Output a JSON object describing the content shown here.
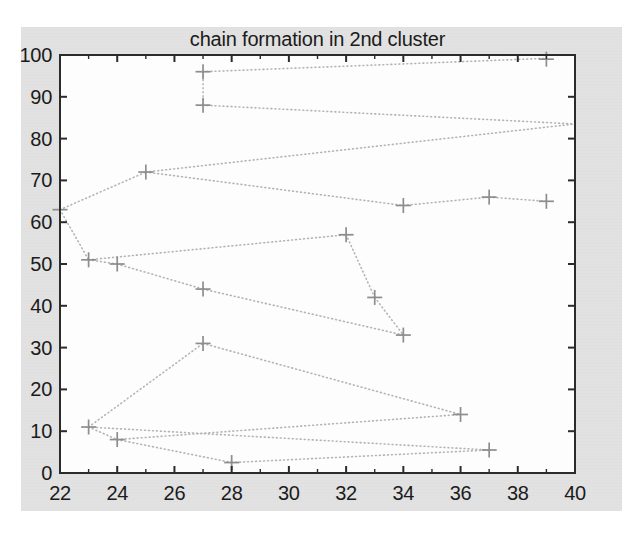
{
  "figure": {
    "title": "chain formation in 2nd cluster",
    "page_background": "#e2e2e2",
    "plot_background": "#fdfdfd",
    "axis_color": "#2b2b2b",
    "marker_color": "#8d8d8d",
    "line_color": "#b4b4b4",
    "text_color": "#1b1b1b"
  },
  "chart_data": {
    "type": "scatter",
    "title": "chain formation in 2nd cluster",
    "xlabel": "",
    "ylabel": "",
    "xlim": [
      22,
      40
    ],
    "ylim": [
      0,
      100
    ],
    "xticks": [
      22,
      24,
      26,
      28,
      30,
      32,
      34,
      36,
      38,
      40
    ],
    "xtick_labels": [
      "22",
      "24",
      "26",
      "28",
      "30",
      "32",
      "34",
      "36",
      "38",
      "40"
    ],
    "yticks": [
      0,
      10,
      20,
      30,
      40,
      50,
      60,
      70,
      80,
      90,
      100
    ],
    "ytick_labels": [
      "0",
      "10",
      "20",
      "30",
      "40",
      "50",
      "60",
      "70",
      "80",
      "90",
      "100"
    ],
    "xminorticks": [
      23,
      25,
      27,
      29,
      31,
      33,
      35,
      37,
      39
    ],
    "grid": false,
    "legend": null,
    "marker_style": "plus",
    "line_style": "dotted",
    "points": [
      {
        "x": 22,
        "y": 63
      },
      {
        "x": 23,
        "y": 51
      },
      {
        "x": 23,
        "y": 11
      },
      {
        "x": 24,
        "y": 50
      },
      {
        "x": 24,
        "y": 8
      },
      {
        "x": 25,
        "y": 72
      },
      {
        "x": 27,
        "y": 96
      },
      {
        "x": 27,
        "y": 88
      },
      {
        "x": 27,
        "y": 44
      },
      {
        "x": 27,
        "y": 31
      },
      {
        "x": 28,
        "y": 2.5
      },
      {
        "x": 32,
        "y": 57
      },
      {
        "x": 33,
        "y": 42
      },
      {
        "x": 34,
        "y": 64
      },
      {
        "x": 34,
        "y": 33
      },
      {
        "x": 36,
        "y": 14
      },
      {
        "x": 37,
        "y": 66
      },
      {
        "x": 37,
        "y": 5.5
      },
      {
        "x": 39,
        "y": 99
      },
      {
        "x": 39,
        "y": 65
      }
    ],
    "series": [
      {
        "name": "chain-1",
        "points": [
          [
            27,
            96
          ],
          [
            39,
            99.2
          ]
        ]
      },
      {
        "name": "chain-2",
        "points": [
          [
            27,
            96
          ],
          [
            27,
            88
          ]
        ]
      },
      {
        "name": "chain-3",
        "points": [
          [
            27,
            88
          ],
          [
            40,
            83.5
          ]
        ]
      },
      {
        "name": "chain-4",
        "points": [
          [
            25,
            72
          ],
          [
            40,
            83.5
          ]
        ]
      },
      {
        "name": "chain-5",
        "points": [
          [
            22,
            63
          ],
          [
            25,
            72
          ]
        ]
      },
      {
        "name": "chain-6",
        "points": [
          [
            25,
            72
          ],
          [
            34,
            64
          ]
        ]
      },
      {
        "name": "chain-7",
        "points": [
          [
            34,
            64
          ],
          [
            37,
            66
          ]
        ]
      },
      {
        "name": "chain-8",
        "points": [
          [
            37,
            66
          ],
          [
            39,
            65
          ]
        ]
      },
      {
        "name": "chain-9",
        "points": [
          [
            22,
            63
          ],
          [
            23,
            51
          ]
        ]
      },
      {
        "name": "chain-10",
        "points": [
          [
            23,
            51
          ],
          [
            32,
            57
          ]
        ]
      },
      {
        "name": "chain-11",
        "points": [
          [
            32,
            57
          ],
          [
            33,
            42
          ]
        ]
      },
      {
        "name": "chain-12",
        "points": [
          [
            33,
            42
          ],
          [
            34,
            33
          ]
        ]
      },
      {
        "name": "chain-13",
        "points": [
          [
            23,
            51
          ],
          [
            24,
            50
          ]
        ]
      },
      {
        "name": "chain-14",
        "points": [
          [
            24,
            50
          ],
          [
            27,
            44
          ]
        ]
      },
      {
        "name": "chain-15",
        "points": [
          [
            27,
            44
          ],
          [
            34,
            33
          ]
        ]
      },
      {
        "name": "chain-16",
        "points": [
          [
            27,
            31
          ],
          [
            36,
            14
          ]
        ]
      },
      {
        "name": "chain-17",
        "points": [
          [
            23,
            11
          ],
          [
            27,
            31
          ]
        ]
      },
      {
        "name": "chain-18",
        "points": [
          [
            23,
            11
          ],
          [
            37,
            5.5
          ]
        ]
      },
      {
        "name": "chain-19",
        "points": [
          [
            23,
            11
          ],
          [
            24,
            8
          ]
        ]
      },
      {
        "name": "chain-20",
        "points": [
          [
            24,
            8
          ],
          [
            36,
            14
          ]
        ]
      },
      {
        "name": "chain-21",
        "points": [
          [
            24,
            8
          ],
          [
            28,
            2.5
          ]
        ]
      },
      {
        "name": "chain-22",
        "points": [
          [
            28,
            2.5
          ],
          [
            37,
            5.5
          ]
        ]
      }
    ]
  }
}
